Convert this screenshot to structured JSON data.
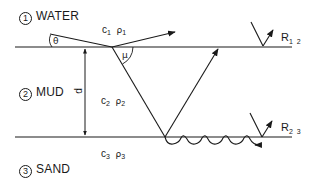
{
  "diagram": {
    "type": "acoustic-layer-reflection-schematic",
    "layers": [
      {
        "number": "1",
        "name": "WATER",
        "speed_symbol": "c",
        "speed_sub": "1",
        "density_symbol": "ρ",
        "density_sub": "1"
      },
      {
        "number": "2",
        "name": "MUD",
        "speed_symbol": "c",
        "speed_sub": "2",
        "density_symbol": "ρ",
        "density_sub": "2"
      },
      {
        "number": "3",
        "name": "SAND",
        "speed_symbol": "c",
        "speed_sub": "3",
        "density_symbol": "ρ",
        "density_sub": "3"
      }
    ],
    "angles": {
      "grazing": "θ",
      "refraction": "μ"
    },
    "thickness_label": "d",
    "reflections": [
      {
        "symbol": "R",
        "sub": "1 2",
        "interface": "water-mud"
      },
      {
        "symbol": "R",
        "sub": "2 3",
        "interface": "mud-sand"
      }
    ],
    "colors": {
      "ink": "#1a1a1a",
      "background": "#ffffff"
    }
  }
}
